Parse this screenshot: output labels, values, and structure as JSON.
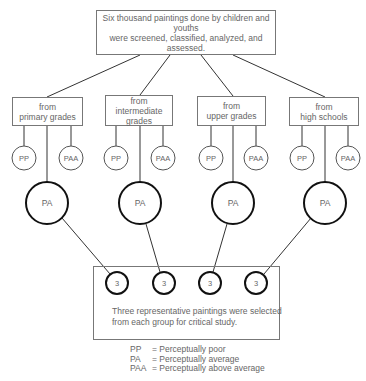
{
  "top_box": {
    "line1": "Six thousand paintings done by children and youths",
    "line2": "were screened, classified, analyzed, and assessed."
  },
  "groups": [
    {
      "line1": "from",
      "line2": "primary grades",
      "line3": "",
      "left": "PP",
      "right": "PAA",
      "center": "PA",
      "selected": "3"
    },
    {
      "line1": "from",
      "line2": "intermediate",
      "line3": "grades",
      "left": "PP",
      "right": "PAA",
      "center": "PA",
      "selected": "3"
    },
    {
      "line1": "from",
      "line2": "upper grades",
      "line3": "",
      "left": "PP",
      "right": "PAA",
      "center": "PA",
      "selected": "3"
    },
    {
      "line1": "from",
      "line2": "high schools",
      "line3": "",
      "left": "PP",
      "right": "PAA",
      "center": "PA",
      "selected": "3"
    }
  ],
  "bottom_box": {
    "line1": "Three representative paintings were selected",
    "line2": "from each group for critical study."
  },
  "legend": [
    {
      "abbr": "PP",
      "def": "= Perceptually poor"
    },
    {
      "abbr": "PA",
      "def": "= Perceptually average"
    },
    {
      "abbr": "PAA",
      "def": "= Perceptually above average"
    }
  ]
}
